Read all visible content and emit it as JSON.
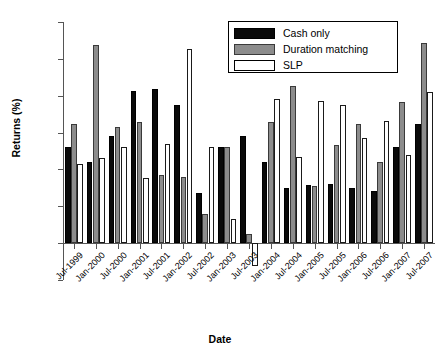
{
  "chart_data": {
    "type": "bar",
    "title": "",
    "xlabel": "Date",
    "ylabel": "Returns (%)",
    "ylim": [
      -0.5,
      3
    ],
    "yticks": [
      -0.5,
      0,
      0.5,
      1,
      1.5,
      2,
      2.5,
      3
    ],
    "ytick_labels": [
      "-0.5",
      "0",
      "0.5",
      "1",
      "1.5",
      "2",
      "2.5",
      "3"
    ],
    "grid": false,
    "legend_position": "top-right",
    "categories": [
      "Jul-1999",
      "Jan-2000",
      "Jul-2000",
      "Jan-2001",
      "Jul-2001",
      "Jan-2002",
      "Jul-2002",
      "Jan-2003",
      "Jul-2003",
      "Jan-2004",
      "Jul-2004",
      "Jan-2005",
      "Jul-2005",
      "Jan-2006",
      "Jul-2006",
      "Jan-2007",
      "Jul-2007"
    ],
    "series": [
      {
        "name": "Cash only",
        "color": "#0a0a0a",
        "values": [
          1.3,
          1.1,
          1.45,
          2.06,
          2.09,
          1.87,
          0.68,
          1.31,
          1.46,
          1.1,
          0.75,
          0.79,
          0.8,
          0.75,
          0.71,
          1.31,
          1.62
        ]
      },
      {
        "name": "Duration matching",
        "color": "#8c8c8c",
        "values": [
          1.62,
          2.69,
          1.57,
          1.65,
          0.92,
          0.9,
          0.39,
          1.31,
          0.13,
          1.65,
          2.13,
          0.77,
          1.33,
          1.62,
          1.1,
          1.92,
          2.72
        ]
      },
      {
        "name": "SLP",
        "color": "#ffffff",
        "values": [
          1.07,
          1.15,
          1.31,
          0.88,
          1.35,
          2.63,
          1.3,
          0.33,
          -0.31,
          1.95,
          1.17,
          1.93,
          1.88,
          1.43,
          1.66,
          1.2,
          2.05
        ]
      }
    ]
  },
  "legend": {
    "items": [
      {
        "label": "Cash only"
      },
      {
        "label": "Duration matching"
      },
      {
        "label": "SLP"
      }
    ]
  }
}
